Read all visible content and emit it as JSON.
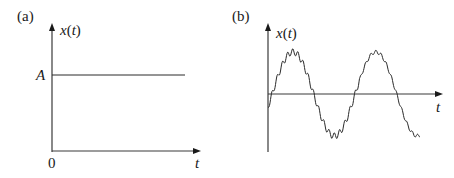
{
  "panels": [
    {
      "id": "a",
      "label": "(a)",
      "y_axis_label_var": "x",
      "y_axis_label_open": "(",
      "y_axis_label_arg": "t",
      "y_axis_label_close": ")",
      "x_axis_label": "t",
      "origin_label": "0",
      "level_label": "A",
      "description": "Constant signal x(t) = A for t >= 0"
    },
    {
      "id": "b",
      "label": "(b)",
      "y_axis_label_var": "x",
      "y_axis_label_open": "(",
      "y_axis_label_arg": "t",
      "y_axis_label_close": ")",
      "x_axis_label": "t",
      "description": "Sinusoidal signal with superimposed high-frequency ripple (noisy sine wave)"
    }
  ],
  "colors": {
    "line": "#2a2a2a",
    "axis": "#3a3a3a",
    "background": "#ffffff"
  }
}
